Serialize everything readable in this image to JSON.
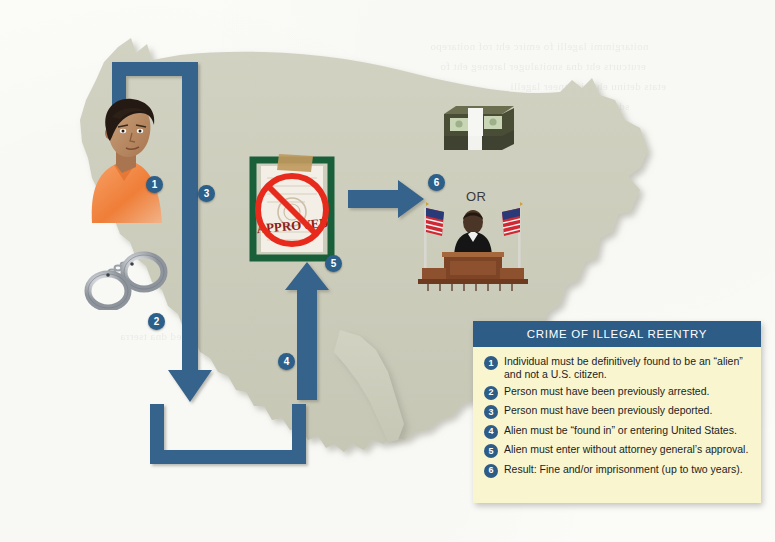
{
  "figure": {
    "type": "infographic-diagram"
  },
  "map": {
    "name": "united-states-outline",
    "fill_color": "#cdcdbd",
    "shadow_color": "#b3b3a4",
    "background_color": "#fbfbf8"
  },
  "flow": {
    "color": "#36638b",
    "steps": [
      {
        "name": "top-left-corner-path",
        "direction": "right-then-down"
      },
      {
        "name": "down-arrow",
        "direction": "down"
      },
      {
        "name": "u-turn-path",
        "direction": "left-up"
      },
      {
        "name": "up-arrow",
        "direction": "up"
      },
      {
        "name": "right-arrow",
        "direction": "right"
      }
    ]
  },
  "badges": [
    {
      "id": "1",
      "label": "1",
      "x": 146,
      "y": 176,
      "target": "person"
    },
    {
      "id": "2",
      "label": "2",
      "x": 148,
      "y": 313,
      "target": "handcuffs"
    },
    {
      "id": "3",
      "label": "3",
      "x": 198,
      "y": 185,
      "target": "deportation-path"
    },
    {
      "id": "4",
      "label": "4",
      "x": 278,
      "y": 353,
      "target": "reentry-arrow"
    },
    {
      "id": "5",
      "label": "5",
      "x": 325,
      "y": 255,
      "target": "denied-approval-document"
    },
    {
      "id": "6",
      "label": "6",
      "x": 428,
      "y": 174,
      "target": "penalty"
    }
  ],
  "labels": {
    "or": "OR"
  },
  "illustrations": {
    "person": {
      "name": "detained-individual",
      "shirt_color": "#f0803c",
      "skin_color": "#c08a63",
      "hair_color": "#231a14"
    },
    "handcuffs": {
      "name": "handcuffs",
      "metal_color": "#c8cbcf"
    },
    "document": {
      "name": "denied-approval-document",
      "border_color": "#19603a",
      "stamp_text": "APPROVED",
      "stamp_color": "#8e2018",
      "prohibition_color": "#e82a1c",
      "tape_color": "#c49a5c"
    },
    "money": {
      "name": "cash-stack",
      "band_color": "#f2f2ee",
      "bill_color": "#4f5235"
    },
    "judge": {
      "name": "judge-at-bench",
      "robe_color": "#1a1a1a",
      "bench_color": "#8a4f2a",
      "flag_count": 2
    }
  },
  "legend": {
    "title": "CRIME OF ILLEGAL REENTRY",
    "header_color": "#2d5c87",
    "body_color": "#f8f5cf",
    "items": [
      {
        "num": "1",
        "text": "Individual must be definitively found to be an “alien” and not a U.S. citizen."
      },
      {
        "num": "2",
        "text": "Person must have been previously arrested."
      },
      {
        "num": "3",
        "text": "Person must have been previously deported."
      },
      {
        "num": "4",
        "text": "Alien must be “found in” or entering United States."
      },
      {
        "num": "5",
        "text": "Alien must enter without attorney general’s approval."
      },
      {
        "num": "6",
        "text": "Result: Fine and/or imprisonment (up to two years)."
      }
    ]
  }
}
